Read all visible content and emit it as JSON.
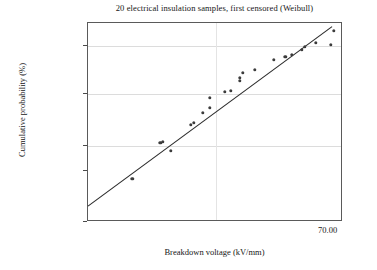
{
  "chart_data": {
    "type": "scatter",
    "title": "20 electrical insulation samples, first censored (Weibull)",
    "xlabel": "Breakdown voltage (kV/mm)",
    "ylabel": "Cumulative probability (%)",
    "plot_kind": "weibull-probability-plot",
    "grid": true,
    "legend": null,
    "y_scale": "weibull",
    "y_tick_labels": [
      "99.00",
      "90.00",
      "50.00",
      "10.00",
      "5.00",
      "1.00"
    ],
    "y_tick_values": [
      99.0,
      90.0,
      50.0,
      10.0,
      5.0,
      1.0
    ],
    "y_tick_pixel_fraction": [
      0.0,
      0.1156,
      0.3568,
      0.6181,
      0.7437,
      1.0
    ],
    "ylim": [
      1.0,
      99.0
    ],
    "x_tick_labels": [
      "70.00"
    ],
    "x_tick_values": [
      70.0
    ],
    "x_tick_pixel_fraction": [
      1.0
    ],
    "gridlines_h_fraction": [
      0.1156,
      0.3568,
      0.6181
    ],
    "gridlines_v_fraction": [
      0.502
    ],
    "n_samples": 20,
    "series": [
      {
        "name": "Median ranks (observed)",
        "marker": "circle",
        "color": "#3c3c3c",
        "points": [
          {
            "x_frac": 0.173,
            "y_frac": 0.784,
            "cum_prob": 3.4
          },
          {
            "x_frac": 0.325,
            "y_frac": 0.643,
            "cum_prob": 8.4
          },
          {
            "x_frac": 0.283,
            "y_frac": 0.603,
            "cum_prob": 11.5
          },
          {
            "x_frac": 0.294,
            "y_frac": 0.598,
            "cum_prob": 11.8
          },
          {
            "x_frac": 0.404,
            "y_frac": 0.513,
            "cum_prob": 18.5
          },
          {
            "x_frac": 0.416,
            "y_frac": 0.503,
            "cum_prob": 19.5
          },
          {
            "x_frac": 0.451,
            "y_frac": 0.452,
            "cum_prob": 25.0
          },
          {
            "x_frac": 0.478,
            "y_frac": 0.427,
            "cum_prob": 28.5
          },
          {
            "x_frac": 0.478,
            "y_frac": 0.377,
            "cum_prob": 35.0
          },
          {
            "x_frac": 0.537,
            "y_frac": 0.347,
            "cum_prob": 39.5
          },
          {
            "x_frac": 0.561,
            "y_frac": 0.342,
            "cum_prob": 40.3
          },
          {
            "x_frac": 0.596,
            "y_frac": 0.291,
            "cum_prob": 48.5
          },
          {
            "x_frac": 0.596,
            "y_frac": 0.276,
            "cum_prob": 51.0
          },
          {
            "x_frac": 0.608,
            "y_frac": 0.251,
            "cum_prob": 55.5
          },
          {
            "x_frac": 0.655,
            "y_frac": 0.236,
            "cum_prob": 58.0
          },
          {
            "x_frac": 0.729,
            "y_frac": 0.186,
            "cum_prob": 66.5
          },
          {
            "x_frac": 0.773,
            "y_frac": 0.171,
            "cum_prob": 69.0
          },
          {
            "x_frac": 0.8,
            "y_frac": 0.161,
            "cum_prob": 71.0
          },
          {
            "x_frac": 0.839,
            "y_frac": 0.136,
            "cum_prob": 76.0
          },
          {
            "x_frac": 0.851,
            "y_frac": 0.121,
            "cum_prob": 79.5
          },
          {
            "x_frac": 0.894,
            "y_frac": 0.101,
            "cum_prob": 83.5
          },
          {
            "x_frac": 0.953,
            "y_frac": 0.111,
            "cum_prob": 81.0
          },
          {
            "x_frac": 0.965,
            "y_frac": 0.04,
            "cum_prob": 93.0
          }
        ]
      }
    ],
    "fit_line": {
      "name": "Weibull maximum-likelihood fit",
      "color": "#2b2b2b",
      "x0_frac": 0.0,
      "y0_frac": 0.92,
      "x1_frac": 0.957,
      "y1_frac": 0.018
    },
    "annotations": [
      "Two early points fall below the fitted line (low-voltage outliers)."
    ]
  },
  "colors": {
    "background": "#ffffff",
    "frame": "#5a5a5a",
    "grid": "#dcdcdc",
    "marker": "#3c3c3c",
    "line": "#2b2b2b",
    "text": "#161616"
  }
}
